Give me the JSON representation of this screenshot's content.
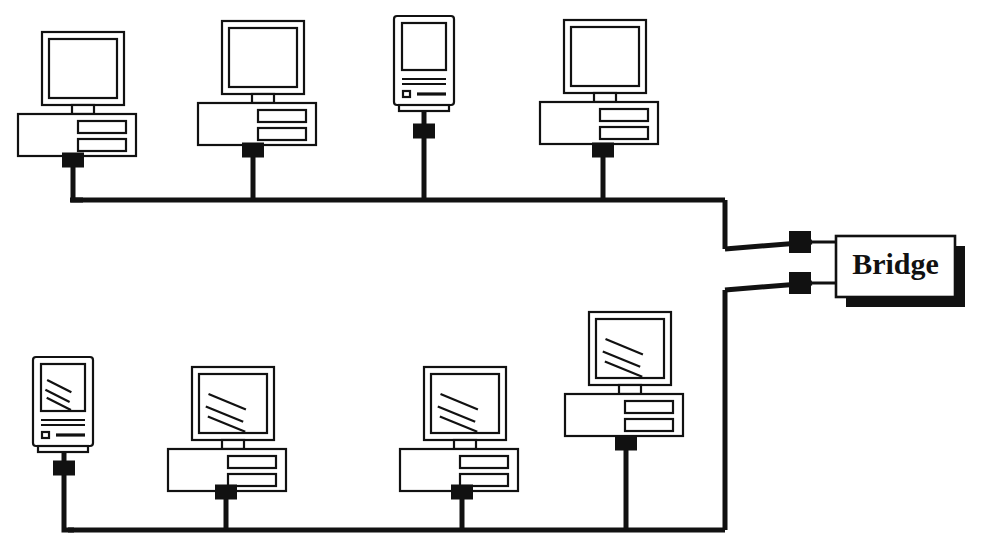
{
  "diagram": {
    "type": "network-topology",
    "background_color": "#ffffff",
    "line_color": "#111111",
    "fill_color": "#ffffff",
    "shadow_color": "#111111",
    "bridge": {
      "label": "Bridge",
      "x": 836,
      "y": 236,
      "width": 119,
      "height": 61,
      "shadow_offset": 10,
      "ports": [
        {
          "name": "port-upper-segment",
          "x": 800,
          "y": 242
        },
        {
          "name": "port-lower-segment",
          "x": 800,
          "y": 283
        }
      ]
    },
    "segments": [
      {
        "name": "upper-segment",
        "bus_y": 200,
        "bus_x_start": 70,
        "bus_x_end": 725,
        "riser_x": 725,
        "riser_to_y": 249,
        "nodes": [
          {
            "name": "workstation-1",
            "style": "desktop",
            "screen_glare": false,
            "x": 18,
            "y": 32,
            "tap_x": 73,
            "tap_y": 160,
            "stem_from_y": 131
          },
          {
            "name": "workstation-2",
            "style": "desktop",
            "screen_glare": false,
            "x": 198,
            "y": 21,
            "tap_x": 253,
            "tap_y": 150,
            "stem_from_y": 124
          },
          {
            "name": "workstation-3",
            "style": "all-in-one",
            "screen_glare": false,
            "x": 394,
            "y": 16,
            "tap_x": 424,
            "tap_y": 131,
            "stem_from_y": 105
          },
          {
            "name": "workstation-4",
            "style": "desktop",
            "screen_glare": false,
            "x": 540,
            "y": 20,
            "tap_x": 603,
            "tap_y": 150,
            "stem_from_y": 126
          }
        ]
      },
      {
        "name": "lower-segment",
        "bus_y": 530,
        "bus_x_start": 68,
        "bus_x_end": 725,
        "riser_x": 725,
        "riser_to_y": 290,
        "nodes": [
          {
            "name": "workstation-5",
            "style": "all-in-one",
            "screen_glare": true,
            "x": 33,
            "y": 357,
            "tap_x": 64,
            "tap_y": 468,
            "stem_from_y": 444
          },
          {
            "name": "workstation-6",
            "style": "desktop",
            "screen_glare": true,
            "x": 168,
            "y": 367,
            "tap_x": 226,
            "tap_y": 492,
            "stem_from_y": 464
          },
          {
            "name": "workstation-7",
            "style": "desktop",
            "screen_glare": true,
            "x": 400,
            "y": 367,
            "tap_x": 462,
            "tap_y": 492,
            "stem_from_y": 464
          },
          {
            "name": "workstation-8",
            "style": "desktop",
            "screen_glare": true,
            "x": 565,
            "y": 312,
            "tap_x": 626,
            "tap_y": 443,
            "stem_from_y": 415
          }
        ]
      }
    ],
    "tap_connector": {
      "name": "bus-tap-connector",
      "width": 22,
      "height": 15
    },
    "desktop_geometry": {
      "monitor_width": 82,
      "monitor_height": 73,
      "monitor_offset_x": 24,
      "screen_inset": 7,
      "neck_width": 22,
      "neck_height": 9,
      "base_width": 118,
      "base_height": 42,
      "slot_width": 48,
      "slot_height": 12
    },
    "allinone_geometry": {
      "body_width": 60,
      "body_height": 89,
      "screen_inset_x": 8,
      "screen_inset_y": 7,
      "screen_height": 47,
      "foot_inset": 5,
      "foot_height": 6
    }
  }
}
